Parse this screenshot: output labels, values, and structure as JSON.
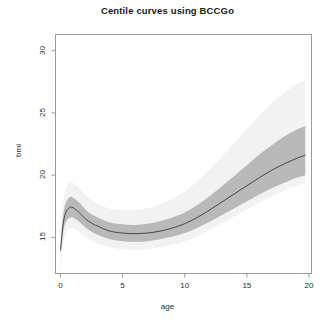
{
  "figure": {
    "title": "Centile curves using BCCGo",
    "width": 335,
    "height": 326,
    "background": "#ffffff"
  },
  "axes": {
    "x_label": "age",
    "y_label": "bmi",
    "x_ticks": [
      "0",
      "5",
      "10",
      "15",
      "20"
    ],
    "y_ticks": [
      "15",
      "20",
      "25",
      "30"
    ]
  },
  "colors": {
    "median_line": "#3a3a3a",
    "inner_band": "#b9b9b9",
    "outer_band": "#f2f2f2",
    "axis": "#8c8c8c",
    "text": "#2b2b2b",
    "title": "#1a1a1a"
  },
  "chart_data": {
    "type": "line",
    "title": "Centile curves using BCCGo",
    "xlabel": "age",
    "ylabel": "bmi",
    "xlim": [
      -0.4,
      20.2
    ],
    "ylim": [
      12.1,
      31.3
    ],
    "xticks": [
      0,
      5,
      10,
      15,
      20
    ],
    "yticks": [
      15,
      20,
      25,
      30
    ],
    "grid": false,
    "legend": "none",
    "x": [
      0.0,
      0.25,
      0.5,
      0.8,
      1.0,
      1.5,
      2.0,
      2.5,
      3.0,
      4.0,
      5.0,
      6.0,
      7.0,
      8.0,
      9.0,
      10.0,
      11.0,
      12.0,
      13.0,
      14.0,
      15.0,
      16.0,
      17.0,
      18.0,
      19.0,
      19.7
    ],
    "series": [
      {
        "name": "median (50th centile)",
        "role": "line",
        "values": [
          13.95,
          16.3,
          17.15,
          17.42,
          17.4,
          17.0,
          16.5,
          16.15,
          15.9,
          15.5,
          15.35,
          15.3,
          15.35,
          15.5,
          15.75,
          16.1,
          16.6,
          17.2,
          17.85,
          18.5,
          19.15,
          19.8,
          20.4,
          20.9,
          21.35,
          21.6
        ]
      },
      {
        "name": "inner centile band lower",
        "role": "band-inner-lower",
        "values": [
          13.6,
          15.6,
          16.35,
          16.6,
          16.6,
          16.25,
          15.8,
          15.45,
          15.2,
          14.85,
          14.7,
          14.65,
          14.7,
          14.85,
          15.05,
          15.35,
          15.75,
          16.25,
          16.8,
          17.35,
          17.9,
          18.45,
          18.95,
          19.4,
          19.8,
          20.0
        ]
      },
      {
        "name": "inner centile band upper",
        "role": "band-inner-upper",
        "values": [
          14.35,
          17.0,
          17.95,
          18.25,
          18.2,
          17.8,
          17.25,
          16.85,
          16.6,
          16.2,
          16.05,
          16.0,
          16.1,
          16.3,
          16.6,
          17.0,
          17.6,
          18.3,
          19.1,
          19.95,
          20.8,
          21.65,
          22.4,
          23.1,
          23.65,
          23.95
        ]
      },
      {
        "name": "outer centile band lower",
        "role": "band-outer-lower",
        "values": [
          12.3,
          14.6,
          15.45,
          15.75,
          15.75,
          15.45,
          15.05,
          14.75,
          14.5,
          14.2,
          14.05,
          14.0,
          14.05,
          14.2,
          14.4,
          14.7,
          15.1,
          15.6,
          16.15,
          16.7,
          17.25,
          17.8,
          18.3,
          18.75,
          19.15,
          19.35
        ]
      },
      {
        "name": "outer centile band upper",
        "role": "band-outer-upper",
        "values": [
          15.6,
          18.1,
          19.1,
          19.45,
          19.4,
          18.95,
          18.4,
          18.0,
          17.7,
          17.3,
          17.2,
          17.2,
          17.35,
          17.65,
          18.1,
          18.7,
          19.5,
          20.45,
          21.5,
          22.6,
          23.7,
          24.8,
          25.8,
          26.6,
          27.3,
          27.6
        ]
      }
    ],
    "annotations": []
  }
}
